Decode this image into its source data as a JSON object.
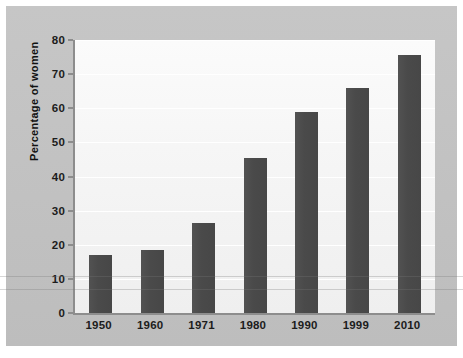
{
  "chart_data": {
    "type": "bar",
    "title": "",
    "xlabel": "",
    "ylabel": "Percentage of women",
    "categories": [
      "1950",
      "1960",
      "1971",
      "1980",
      "1990",
      "1999",
      "2010"
    ],
    "values": [
      17,
      18.5,
      26.5,
      45.5,
      59,
      66,
      75.5
    ],
    "ylim": [
      0,
      80
    ],
    "yticks": [
      0,
      10,
      20,
      30,
      40,
      50,
      60,
      70,
      80
    ],
    "ytick_labels": [
      "0",
      "10",
      "20",
      "30",
      "40",
      "50",
      "60",
      "70",
      "80"
    ],
    "grid": true,
    "legend": "none",
    "series": [
      {
        "name": "Percentage of women",
        "values": [
          17,
          18.5,
          26.5,
          45.5,
          59,
          66,
          75.5
        ]
      }
    ],
    "colors": {
      "bar": "#4a4a4a",
      "plot_background": "#f6f6f6",
      "page_background": "#c3c3c3",
      "axis": "#8d8d8d",
      "text": "#1c1c1c",
      "gridline": "#ffffff"
    }
  }
}
